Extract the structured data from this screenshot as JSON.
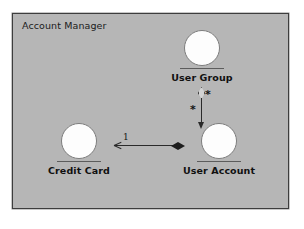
{
  "diagram": {
    "type": "uml-component-diagram",
    "package": {
      "title": "Account Manager"
    },
    "nodes": [
      {
        "id": "user-group",
        "label": "User Group",
        "notation": "interface-lollipop",
        "center_x": 201,
        "circle_top": 29
      },
      {
        "id": "credit-card",
        "label": "Credit Card",
        "notation": "interface-lollipop",
        "center_x": 78,
        "circle_top": 122
      },
      {
        "id": "user-account",
        "label": "User Account",
        "notation": "interface-lollipop",
        "center_x": 218,
        "circle_top": 122
      }
    ],
    "connectors": [
      {
        "id": "usergroup-useraccount",
        "kind": "aggregation",
        "from": "user-group",
        "to": "user-account",
        "source_end": "hollow-diamond",
        "target_end": "open-arrow",
        "orientation": "vertical",
        "source_multiplicity": "*",
        "target_multiplicity": "*"
      },
      {
        "id": "creditcard-useraccount",
        "kind": "composition",
        "from": "user-account",
        "to": "credit-card",
        "source_end": "filled-diamond",
        "target_end": "open-arrow",
        "orientation": "horizontal",
        "source_multiplicity": "",
        "target_multiplicity": "1"
      }
    ],
    "colors": {
      "page_background": "#ffffff",
      "package_fill": "#b6b6b6",
      "package_border": "#3d3d3d",
      "node_fill": "#fdfdfd",
      "node_stroke": "#7d7d7d",
      "connector": "#2a2a2a",
      "text": "#101010"
    }
  }
}
